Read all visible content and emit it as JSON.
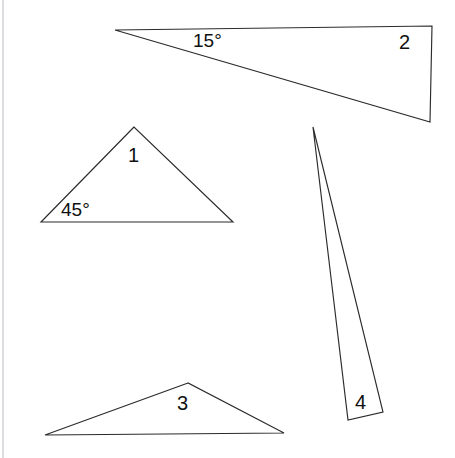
{
  "figure": {
    "canvas": {
      "width": 455,
      "height": 458
    },
    "background_color": "#ffffff",
    "stroke_color": "#2b2b2b",
    "scan_edge_color": "#b9bcc2",
    "shapes": [
      {
        "id": "triangle-2",
        "label": "2",
        "angle_label": "15°",
        "points": "115,30 432,26 430,122"
      },
      {
        "id": "triangle-1",
        "label": "1",
        "angle_label": "45°",
        "points": "134,127 41,222 233,222"
      },
      {
        "id": "triangle-4",
        "label": "4",
        "angle_label": "",
        "points": "313,127 348,420 383,412"
      },
      {
        "id": "triangle-3",
        "label": "3",
        "angle_label": "",
        "points": "188,383 45,435 284,433"
      }
    ],
    "labels": [
      {
        "id": "label-angle-15",
        "text": "15°",
        "x": 193,
        "y": 31
      },
      {
        "id": "label-tri-2",
        "text": "2",
        "x": 399,
        "y": 32
      },
      {
        "id": "label-tri-1",
        "text": "1",
        "x": 128,
        "y": 145
      },
      {
        "id": "label-angle-45",
        "text": "45°",
        "x": 61,
        "y": 200
      },
      {
        "id": "label-tri-3",
        "text": "3",
        "x": 177,
        "y": 393
      },
      {
        "id": "label-tri-4",
        "text": "4",
        "x": 355,
        "y": 392
      }
    ]
  }
}
